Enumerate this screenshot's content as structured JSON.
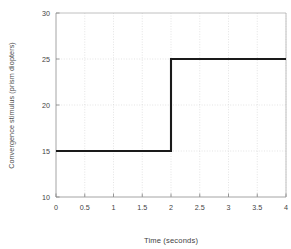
{
  "chart_data": {
    "type": "line",
    "title": "",
    "subtitle": "",
    "xlabel": "Time (seconds)",
    "ylabel": "Convergence stimulus (prism diopters)",
    "xlim": [
      0,
      4
    ],
    "ylim": [
      10,
      30
    ],
    "xticks": [
      0,
      0.5,
      1,
      1.5,
      2,
      2.5,
      3,
      3.5,
      4
    ],
    "xticklabels": [
      "0",
      "0.5",
      "1",
      "1.5",
      "2",
      "2.5",
      "3",
      "3.5",
      "4"
    ],
    "yticks": [
      10,
      15,
      20,
      25,
      30
    ],
    "yticklabels": [
      "10",
      "15",
      "20",
      "25",
      "30"
    ],
    "grid": true,
    "grid_style": "dotted",
    "legend": false,
    "legend_position": "none",
    "line_color": "#1a1a1a",
    "grid_color": "#d9d9d9",
    "axis_color": "#9a9a9a",
    "series": [
      {
        "name": "Convergence stimulus",
        "step": "post",
        "x": [
          0,
          2,
          2,
          4
        ],
        "values": [
          15,
          15,
          25,
          25
        ]
      }
    ],
    "annotations": [
      "Step change from 15 prism diopters to 25 prism diopters at t = 2 seconds"
    ]
  }
}
